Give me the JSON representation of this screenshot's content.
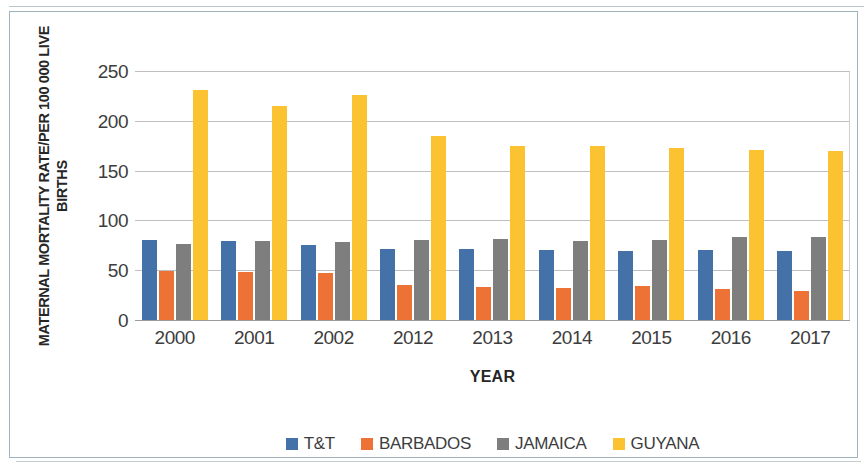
{
  "chart_data": {
    "type": "bar",
    "title": "",
    "xlabel": "YEAR",
    "ylabel": "MATERNAL MORTALITY RATE/PER 100 000 LIVE BIRTHS",
    "ylabel_line1": "MATERNAL MORTALITY RATE/PER 100 000 LIVE",
    "ylabel_line2": "BIRTHS",
    "categories": [
      "2000",
      "2001",
      "2002",
      "2012",
      "2013",
      "2014",
      "2015",
      "2016",
      "2017"
    ],
    "ylim": [
      0,
      250
    ],
    "yticks": [
      0,
      50,
      100,
      150,
      200,
      250
    ],
    "grid": true,
    "legend_position": "bottom",
    "series": [
      {
        "name": "T&T",
        "color": "#4472a8",
        "values": [
          81,
          80,
          76,
          72,
          72,
          71,
          70,
          71,
          70
        ]
      },
      {
        "name": "BARBADOS",
        "color": "#ed7235",
        "values": [
          50,
          49,
          48,
          36,
          34,
          33,
          35,
          32,
          30
        ]
      },
      {
        "name": "JAMAICA",
        "color": "#7e7e7e",
        "values": [
          77,
          80,
          79,
          81,
          82,
          80,
          81,
          84,
          84
        ]
      },
      {
        "name": "GUYANA",
        "color": "#fbc231",
        "values": [
          232,
          216,
          227,
          186,
          176,
          176,
          174,
          172,
          171
        ]
      }
    ]
  }
}
